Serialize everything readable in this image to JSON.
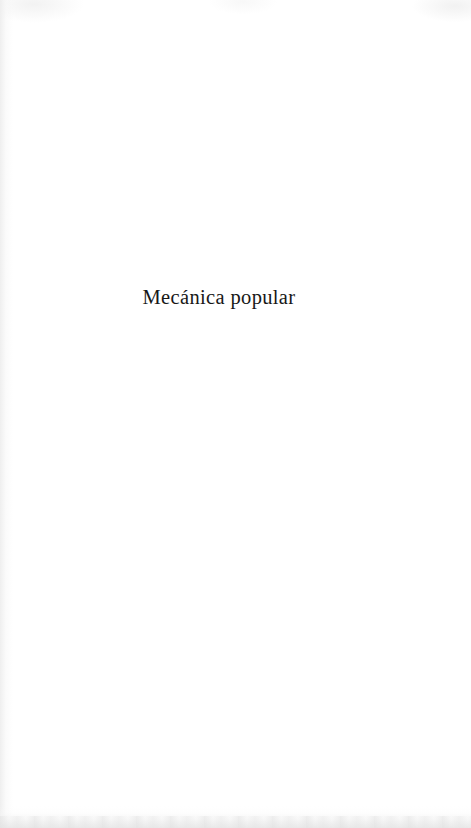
{
  "page": {
    "kind": "scanned-book-section-title-page",
    "background_color": "#ffffff",
    "ink_color": "#181818",
    "width": 471,
    "height": 828
  },
  "content": {
    "section_title": "Mecánica popular"
  },
  "artifacts": {
    "left_gutter_shade": "#ececec",
    "bottom_edge_shade": "#e5e5e5",
    "top_edge_shade": "#eeeeee"
  }
}
